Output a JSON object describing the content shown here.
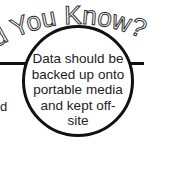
{
  "header": {
    "visible_title": "id You Know?"
  },
  "callout": {
    "text": "Data should be backed up onto portable media and kept off-site",
    "lines": [
      "Data should be",
      "backed up onto",
      "portable media",
      "and kept off-",
      "site"
    ]
  },
  "left_fragment": "d",
  "colors": {
    "outline": "#111111",
    "background": "#ffffff",
    "text": "#222222"
  }
}
